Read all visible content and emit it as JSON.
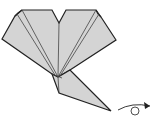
{
  "diagram": {
    "type": "origami-step",
    "colors": {
      "paper": "#d4d4d4",
      "stroke": "#222222",
      "crease": "#444444",
      "background": "#ffffff"
    },
    "symbols": [
      {
        "name": "turn-over-arrow",
        "meaning": "turn model over"
      }
    ]
  }
}
